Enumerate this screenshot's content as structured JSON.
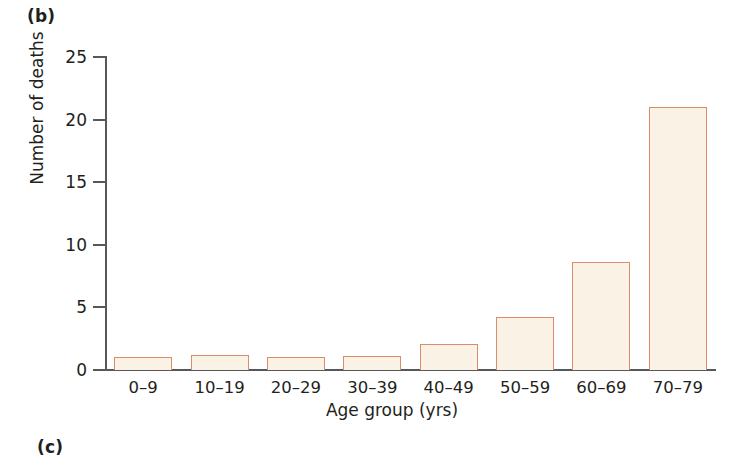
{
  "figure": {
    "panel_label_b": "(b)",
    "panel_label_c": "(c)"
  },
  "colors": {
    "bar_fill": "#fbf2e6",
    "bar_border": "#dd8c6b",
    "axis": "#55595c",
    "text": "#231f20",
    "background": "#ffffff"
  },
  "chart_data": {
    "type": "bar",
    "title": "",
    "xlabel": "Age group (yrs)",
    "ylabel": "Number of deaths",
    "categories": [
      "0–9",
      "10–19",
      "20–29",
      "30–39",
      "40–49",
      "50–59",
      "60–69",
      "70–79"
    ],
    "values": [
      1,
      1.2,
      1,
      1.1,
      2.1,
      4.2,
      8.6,
      21
    ],
    "ylim": [
      0,
      25
    ],
    "yticks": [
      0,
      5,
      10,
      15,
      20,
      25
    ],
    "ytick_labels": [
      "0",
      "5",
      "10",
      "15",
      "20",
      "25"
    ],
    "grid": false,
    "legend": null
  }
}
